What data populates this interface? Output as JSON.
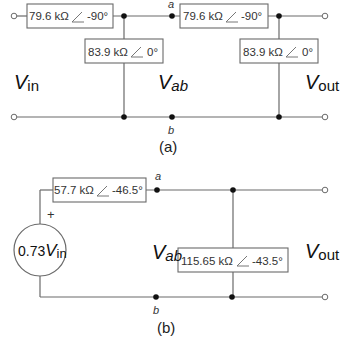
{
  "figure": {
    "circuit_a": {
      "caption": "(a)",
      "series_element_1": {
        "magnitude": "79.6 kΩ",
        "angle": "-90°"
      },
      "shunt_element_1": {
        "magnitude": "83.9 kΩ",
        "angle": "0°"
      },
      "series_element_2": {
        "magnitude": "79.6 kΩ",
        "angle": "-90°"
      },
      "shunt_element_2": {
        "magnitude": "83.9 kΩ",
        "angle": "0°"
      },
      "input_label": {
        "main": "V",
        "sub": "in"
      },
      "mid_label": {
        "main": "V",
        "sub": "ab"
      },
      "output_label": {
        "main": "V",
        "sub": "out"
      },
      "node_a": "a",
      "node_b": "b"
    },
    "circuit_b": {
      "caption": "(b)",
      "source": {
        "coef": "0.73",
        "main": "V",
        "sub": "in",
        "polarity": "+"
      },
      "series_element": {
        "magnitude": "57.7 kΩ",
        "angle": "-46.5°"
      },
      "shunt_element": {
        "magnitude": "115.65 kΩ",
        "angle": "-43.5°"
      },
      "mid_label": {
        "main": "V",
        "sub": "ab"
      },
      "output_label": {
        "main": "V",
        "sub": "out"
      },
      "node_a": "a",
      "node_b": "b"
    }
  }
}
